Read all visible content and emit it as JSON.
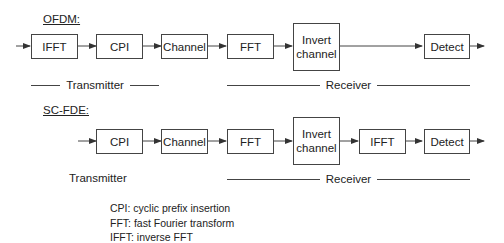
{
  "ofdm": {
    "title": "OFDM:",
    "blocks": [
      "IFFT",
      "CPI",
      "Channel",
      "FFT",
      "Invert channel",
      "Detect"
    ],
    "transmitter_label": "Transmitter",
    "receiver_label": "Receiver"
  },
  "scfde": {
    "title": "SC-FDE:",
    "blocks": [
      "CPI",
      "Channel",
      "FFT",
      "Invert channel",
      "IFFT",
      "Detect"
    ],
    "transmitter_label": "Transmitter",
    "receiver_label": "Receiver"
  },
  "legend": [
    "CPI: cyclic prefix insertion",
    "FFT: fast Fourier transform",
    "IFFT: inverse FFT"
  ],
  "colors": {
    "line": "#444444",
    "text": "#222222",
    "background": "#ffffff"
  }
}
